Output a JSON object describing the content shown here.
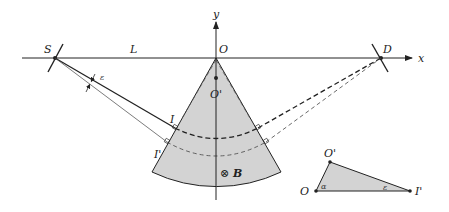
{
  "diagram": {
    "type": "physics-geometry",
    "colors": {
      "stroke": "#222222",
      "sector_fill": "#d3d3d3",
      "background": "#ffffff"
    },
    "axes": {
      "x_label": "x",
      "y_label": "y",
      "origin_label": "O"
    },
    "points": {
      "source": "S",
      "detector": "D",
      "center": "O",
      "center_prime": "O'",
      "incidence": "I",
      "incidence_prime": "I'"
    },
    "labels": {
      "distance": "L",
      "angle_epsilon": "ε",
      "magnetic_field_symbol": "⊗",
      "magnetic_field": "B"
    },
    "inset_triangle": {
      "vertices": [
        "O",
        "O'",
        "I'"
      ],
      "angle_at_O": "α",
      "angle_at_I_prime": "ε"
    }
  }
}
